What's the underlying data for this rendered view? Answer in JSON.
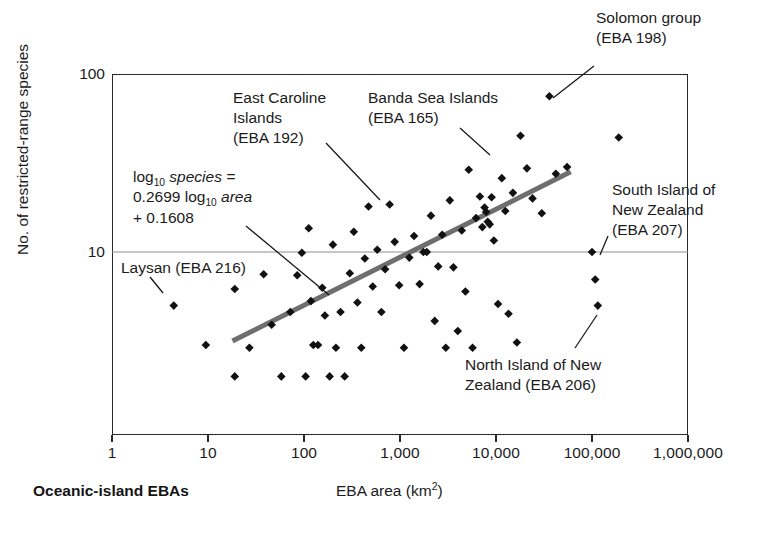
{
  "figure": {
    "corner_label": "Oceanic-island EBAs",
    "xlabel_text": "EBA area (km",
    "xlabel_sup": "2",
    "xlabel_tail": ")",
    "ylabel": "No. of restricted-range species"
  },
  "equation": {
    "line1_pre": "log",
    "line1_sub": "10",
    "line1_post": " species =",
    "line2_pre": "0.2699 log",
    "line2_sub": "10",
    "line2_post": " area",
    "line3": "+ 0.1608"
  },
  "annotations": [
    {
      "name": "annot-east-caroline",
      "lines": "East Caroline\nIslands\n(EBA 192)",
      "x": 233,
      "y": 88,
      "align": "left"
    },
    {
      "name": "annot-banda-sea",
      "lines": "Banda Sea Islands\n(EBA 165)",
      "x": 368,
      "y": 88,
      "align": "left"
    },
    {
      "name": "annot-solomon-group",
      "lines": "Solomon group\n(EBA 198)",
      "x": 596,
      "y": 8,
      "align": "left"
    },
    {
      "name": "annot-south-island-nz",
      "lines": "South Island of\nNew Zealand\n(EBA 207)",
      "x": 612,
      "y": 180,
      "align": "left"
    },
    {
      "name": "annot-north-island-nz",
      "lines": "North Island of New\nZealand (EBA 206)",
      "x": 465,
      "y": 355,
      "align": "left"
    },
    {
      "name": "annot-laysan",
      "lines": "Laysan (EBA 216)",
      "x": 121,
      "y": 258,
      "align": "left"
    }
  ],
  "chart_data": {
    "type": "scatter",
    "title": "",
    "xlabel": "EBA area (km2)",
    "ylabel": "No. of restricted-range species",
    "xscale": "log",
    "yscale": "log",
    "xlim": [
      1,
      1000000
    ],
    "ylim": [
      1.8,
      120
    ],
    "grid": "horizontal-at-yticks",
    "legend": "none",
    "xticks": [
      1,
      10,
      100,
      1000,
      10000,
      100000,
      1000000
    ],
    "xticklabels": [
      "1",
      "10",
      "100",
      "1,000",
      "10,000",
      "100,000",
      "1,000,000"
    ],
    "yticks": [
      10,
      100
    ],
    "yticklabels": [
      "10",
      "100"
    ],
    "trendline": {
      "label": "log10 species = 0.2699 log10 area + 0.1608",
      "slope": 0.2699,
      "intercept": 0.1608,
      "x_start": 18,
      "x_end": 60000
    },
    "points": [
      {
        "x": 4.4,
        "y": 5.0,
        "label": "Laysan (EBA 216)"
      },
      {
        "x": 9.5,
        "y": 3.0
      },
      {
        "x": 19,
        "y": 6.2
      },
      {
        "x": 19,
        "y": 2.0
      },
      {
        "x": 27,
        "y": 2.9
      },
      {
        "x": 38,
        "y": 7.5
      },
      {
        "x": 46,
        "y": 3.9
      },
      {
        "x": 58,
        "y": 2.0
      },
      {
        "x": 72,
        "y": 4.6
      },
      {
        "x": 85,
        "y": 7.4
      },
      {
        "x": 95,
        "y": 9.9
      },
      {
        "x": 104,
        "y": 2.0
      },
      {
        "x": 112,
        "y": 13.6
      },
      {
        "x": 118,
        "y": 5.3
      },
      {
        "x": 125,
        "y": 3.0
      },
      {
        "x": 140,
        "y": 3.0
      },
      {
        "x": 155,
        "y": 6.3
      },
      {
        "x": 165,
        "y": 4.4
      },
      {
        "x": 185,
        "y": 2.0
      },
      {
        "x": 200,
        "y": 11.0
      },
      {
        "x": 215,
        "y": 2.9
      },
      {
        "x": 240,
        "y": 4.6
      },
      {
        "x": 265,
        "y": 2.0
      },
      {
        "x": 300,
        "y": 7.6
      },
      {
        "x": 330,
        "y": 13.0
      },
      {
        "x": 360,
        "y": 5.2
      },
      {
        "x": 395,
        "y": 2.9
      },
      {
        "x": 430,
        "y": 9.2
      },
      {
        "x": 470,
        "y": 18.0
      },
      {
        "x": 520,
        "y": 6.4
      },
      {
        "x": 580,
        "y": 10.3
      },
      {
        "x": 640,
        "y": 4.6
      },
      {
        "x": 700,
        "y": 8.0
      },
      {
        "x": 780,
        "y": 18.5
      },
      {
        "x": 880,
        "y": 11.4
      },
      {
        "x": 980,
        "y": 6.5
      },
      {
        "x": 1100,
        "y": 2.9
      },
      {
        "x": 1250,
        "y": 9.3
      },
      {
        "x": 1400,
        "y": 12.3
      },
      {
        "x": 1600,
        "y": 6.6
      },
      {
        "x": 1750,
        "y": 10.0
      },
      {
        "x": 1900,
        "y": 10.0
      },
      {
        "x": 2100,
        "y": 16.0
      },
      {
        "x": 2300,
        "y": 4.1
      },
      {
        "x": 2500,
        "y": 8.3
      },
      {
        "x": 2750,
        "y": 12.5
      },
      {
        "x": 3000,
        "y": 2.9
      },
      {
        "x": 3300,
        "y": 19.5
      },
      {
        "x": 3600,
        "y": 8.2
      },
      {
        "x": 4000,
        "y": 3.6
      },
      {
        "x": 4400,
        "y": 13.2
      },
      {
        "x": 4800,
        "y": 6.0
      },
      {
        "x": 5200,
        "y": 29.0
      },
      {
        "x": 5700,
        "y": 2.9
      },
      {
        "x": 6200,
        "y": 15.5
      },
      {
        "x": 6800,
        "y": 20.5
      },
      {
        "x": 7200,
        "y": 13.8
      },
      {
        "x": 7600,
        "y": 17.8
      },
      {
        "x": 7900,
        "y": 16.8
      },
      {
        "x": 8200,
        "y": 14.8
      },
      {
        "x": 8600,
        "y": 14.3
      },
      {
        "x": 9000,
        "y": 20.3
      },
      {
        "x": 9500,
        "y": 11.6
      },
      {
        "x": 10500,
        "y": 5.1
      },
      {
        "x": 11500,
        "y": 26.0
      },
      {
        "x": 12500,
        "y": 17.0
      },
      {
        "x": 13500,
        "y": 4.5
      },
      {
        "x": 15000,
        "y": 21.5
      },
      {
        "x": 16500,
        "y": 3.1
      },
      {
        "x": 18000,
        "y": 45.0,
        "label": "Banda Sea Islands (EBA 165)"
      },
      {
        "x": 21000,
        "y": 29.5
      },
      {
        "x": 24000,
        "y": 20.0
      },
      {
        "x": 30000,
        "y": 16.5
      },
      {
        "x": 36000,
        "y": 75.0,
        "label": "Solomon group (EBA 198)"
      },
      {
        "x": 42000,
        "y": 27.5
      },
      {
        "x": 55000,
        "y": 30.0
      },
      {
        "x": 100000,
        "y": 10.0,
        "label": "South Island of New Zealand (EBA 207)"
      },
      {
        "x": 108000,
        "y": 7.0
      },
      {
        "x": 115000,
        "y": 5.0,
        "label": "North Island of New Zealand (EBA 206)"
      },
      {
        "x": 190000,
        "y": 44.0
      }
    ]
  }
}
